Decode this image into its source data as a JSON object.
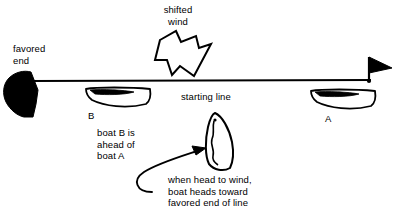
{
  "diagram": {
    "background_color": "#ffffff",
    "ink_color": "#000000",
    "labels": {
      "shifted_wind": "shifted\nwind",
      "favored_end": "favored\nend",
      "starting_line": "starting line",
      "boat_b_marker": "B",
      "boat_a_marker": "A",
      "boat_b_ahead": "boat B is\nahead of\nboat A",
      "head_to_wind_note": "when head to wind,\nboat heads toward\nfavored end of line"
    },
    "elements": {
      "start_line": {
        "name": "starting-line",
        "x1": 30,
        "y1": 81,
        "x2": 371,
        "y2": 80
      },
      "favored_end_mark": {
        "name": "favored-end-pennant",
        "fill": "#000000",
        "position": "left end of starting line"
      },
      "committee_flag": {
        "name": "committee-boat-flag",
        "fill": "#000000",
        "position": "right end of starting line"
      },
      "wind_arrow": {
        "name": "shifted-wind-arrow",
        "style": "hollow outline",
        "direction": "down-right"
      },
      "boat_b": {
        "name": "boat-b",
        "heading": "port, bow to left",
        "position": "left of center, below line"
      },
      "boat_a": {
        "name": "boat-a",
        "heading": "port, bow to left",
        "position": "right of center, below line"
      },
      "boat_head_to_wind": {
        "name": "boat-head-to-wind",
        "heading": "bow up, sail luffing",
        "position": "center, below line"
      },
      "pointer_arrow": {
        "name": "note-pointer-arrow",
        "from": "head-to-wind note",
        "to": "boat-head-to-wind"
      }
    }
  }
}
